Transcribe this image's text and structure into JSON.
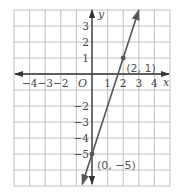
{
  "chart_data": {
    "type": "line",
    "title": "",
    "xlabel": "x",
    "ylabel": "y",
    "xlim": [
      -5,
      5
    ],
    "ylim": [
      -7,
      4
    ],
    "grid": true,
    "x_tick_labels": [
      "−4",
      "−3",
      "−2",
      "1",
      "2",
      "3",
      "4"
    ],
    "x_tick_values": [
      -4,
      -3,
      -2,
      1,
      2,
      3,
      4
    ],
    "y_tick_labels": [
      "3",
      "2",
      "1",
      "−2",
      "−3",
      "−4",
      "−5"
    ],
    "y_tick_values": [
      3,
      2,
      1,
      -2,
      -3,
      -4,
      -5
    ],
    "origin_label": "O",
    "series": [
      {
        "name": "y = 3x − 5",
        "slope": 3,
        "intercept": -5,
        "x": [
          -0.63,
          3
        ],
        "y": [
          -6.9,
          4
        ],
        "color": "#555555"
      }
    ],
    "points": [
      {
        "x": 2,
        "y": 1,
        "label": "(2, 1)"
      },
      {
        "x": 0,
        "y": -5,
        "label": "(0, −5)"
      }
    ]
  },
  "colors": {
    "grid": "#b9b9b9",
    "axis": "#333333",
    "line": "#555555",
    "text": "#444444"
  }
}
